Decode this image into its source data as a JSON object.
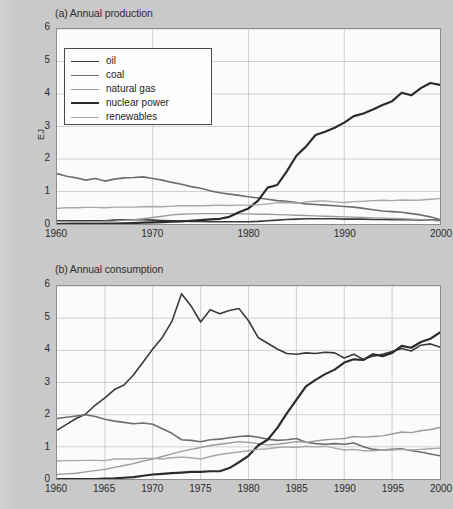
{
  "figure": {
    "ylabel": "EJ",
    "caption": ""
  },
  "legend": {
    "items": [
      {
        "label": "oil",
        "color": "#3a3a3a",
        "width": 1.6
      },
      {
        "label": "coal",
        "color": "#6e6e6e",
        "width": 1.6
      },
      {
        "label": "natural gas",
        "color": "#9b9b9b",
        "width": 1.4
      },
      {
        "label": "nuclear power",
        "color": "#2b2b2b",
        "width": 2.2
      },
      {
        "label": "renewables",
        "color": "#a8a8a8",
        "width": 1.4
      }
    ]
  },
  "chart_data": [
    {
      "type": "line",
      "panel": "a",
      "title": "(a) Annual production",
      "xlabel": "",
      "ylabel": "EJ",
      "xlim": [
        1960,
        2000
      ],
      "ylim": [
        0,
        6
      ],
      "xticks": [
        1960,
        1970,
        1980,
        1990,
        2000
      ],
      "yticks": [
        0,
        1,
        2,
        3,
        4,
        5,
        6
      ],
      "grid": true,
      "legend_position": "upper-left",
      "x": [
        1960,
        1961,
        1962,
        1963,
        1964,
        1965,
        1966,
        1967,
        1968,
        1969,
        1970,
        1971,
        1972,
        1973,
        1974,
        1975,
        1976,
        1977,
        1978,
        1979,
        1980,
        1981,
        1982,
        1983,
        1984,
        1985,
        1986,
        1987,
        1988,
        1989,
        1990,
        1991,
        1992,
        1993,
        1994,
        1995,
        1996,
        1997,
        1998,
        1999,
        2000
      ],
      "series": [
        {
          "name": "oil",
          "color": "#3a3a3a",
          "values": [
            0.1,
            0.1,
            0.1,
            0.1,
            0.1,
            0.1,
            0.12,
            0.13,
            0.13,
            0.13,
            0.12,
            0.11,
            0.1,
            0.09,
            0.08,
            0.08,
            0.07,
            0.07,
            0.07,
            0.07,
            0.07,
            0.08,
            0.1,
            0.12,
            0.14,
            0.15,
            0.16,
            0.16,
            0.16,
            0.16,
            0.15,
            0.15,
            0.15,
            0.14,
            0.14,
            0.13,
            0.13,
            0.13,
            0.12,
            0.12,
            0.12
          ]
        },
        {
          "name": "coal",
          "color": "#6e6e6e",
          "values": [
            1.55,
            1.47,
            1.42,
            1.35,
            1.4,
            1.32,
            1.38,
            1.42,
            1.43,
            1.45,
            1.4,
            1.35,
            1.28,
            1.22,
            1.15,
            1.1,
            1.02,
            0.96,
            0.92,
            0.88,
            0.84,
            0.8,
            0.76,
            0.72,
            0.7,
            0.66,
            0.62,
            0.6,
            0.58,
            0.56,
            0.54,
            0.52,
            0.48,
            0.44,
            0.4,
            0.38,
            0.36,
            0.32,
            0.28,
            0.22,
            0.14
          ]
        },
        {
          "name": "natural gas",
          "color": "#9b9b9b",
          "values": [
            0.02,
            0.03,
            0.04,
            0.05,
            0.06,
            0.08,
            0.09,
            0.11,
            0.13,
            0.16,
            0.2,
            0.24,
            0.28,
            0.3,
            0.31,
            0.32,
            0.32,
            0.32,
            0.32,
            0.31,
            0.31,
            0.3,
            0.3,
            0.29,
            0.28,
            0.27,
            0.26,
            0.25,
            0.24,
            0.23,
            0.22,
            0.21,
            0.2,
            0.19,
            0.18,
            0.17,
            0.16,
            0.15,
            0.13,
            0.11,
            0.09
          ]
        },
        {
          "name": "nuclear power",
          "color": "#2b2b2b",
          "values": [
            0.0,
            0.0,
            0.0,
            0.0,
            0.0,
            0.01,
            0.01,
            0.02,
            0.03,
            0.04,
            0.05,
            0.06,
            0.07,
            0.08,
            0.1,
            0.12,
            0.14,
            0.16,
            0.22,
            0.36,
            0.48,
            0.72,
            1.12,
            1.2,
            1.62,
            2.1,
            2.38,
            2.74,
            2.84,
            2.96,
            3.12,
            3.32,
            3.4,
            3.52,
            3.66,
            3.78,
            4.04,
            3.96,
            4.18,
            4.34,
            4.28,
            4.36,
            4.56
          ]
        },
        {
          "name": "renewables",
          "color": "#a8a8a8",
          "values": [
            0.48,
            0.5,
            0.5,
            0.51,
            0.51,
            0.5,
            0.52,
            0.52,
            0.52,
            0.53,
            0.54,
            0.53,
            0.55,
            0.56,
            0.56,
            0.56,
            0.57,
            0.58,
            0.57,
            0.58,
            0.58,
            0.59,
            0.62,
            0.65,
            0.66,
            0.64,
            0.68,
            0.7,
            0.71,
            0.68,
            0.66,
            0.69,
            0.7,
            0.72,
            0.73,
            0.72,
            0.74,
            0.73,
            0.74,
            0.76,
            0.78
          ]
        }
      ]
    },
    {
      "type": "line",
      "panel": "b",
      "title": "(b) Annual consumption",
      "xlabel": "",
      "ylabel": "EJ",
      "xlim": [
        1960,
        2000
      ],
      "ylim": [
        0,
        6
      ],
      "xticks": [
        1960,
        1965,
        1970,
        1975,
        1980,
        1985,
        1990,
        1995,
        2000
      ],
      "yticks": [
        0,
        1,
        2,
        3,
        4,
        5,
        6
      ],
      "grid": true,
      "legend_position": "none",
      "x": [
        1960,
        1961,
        1962,
        1963,
        1964,
        1965,
        1966,
        1967,
        1968,
        1969,
        1970,
        1971,
        1972,
        1973,
        1974,
        1975,
        1976,
        1977,
        1978,
        1979,
        1980,
        1981,
        1982,
        1983,
        1984,
        1985,
        1986,
        1987,
        1988,
        1989,
        1990,
        1991,
        1992,
        1993,
        1994,
        1995,
        1996,
        1997,
        1998,
        1999,
        2000
      ],
      "series": [
        {
          "name": "oil",
          "color": "#3a3a3a",
          "values": [
            1.52,
            1.7,
            1.88,
            2.02,
            2.3,
            2.52,
            2.78,
            2.92,
            3.24,
            3.64,
            4.04,
            4.4,
            4.9,
            5.76,
            5.38,
            4.88,
            5.26,
            5.14,
            5.24,
            5.3,
            4.92,
            4.4,
            4.22,
            4.04,
            3.9,
            3.88,
            3.92,
            3.9,
            3.94,
            3.92,
            3.76,
            3.88,
            3.72,
            3.82,
            3.88,
            3.96,
            4.06,
            3.98,
            4.16,
            4.2,
            4.1
          ]
        },
        {
          "name": "coal",
          "color": "#6e6e6e",
          "values": [
            1.88,
            1.92,
            1.96,
            2.0,
            1.94,
            1.86,
            1.8,
            1.76,
            1.72,
            1.74,
            1.7,
            1.56,
            1.42,
            1.22,
            1.2,
            1.16,
            1.22,
            1.24,
            1.28,
            1.32,
            1.34,
            1.3,
            1.24,
            1.2,
            1.22,
            1.26,
            1.14,
            1.1,
            1.08,
            1.1,
            1.08,
            1.12,
            1.0,
            0.92,
            0.9,
            0.92,
            0.94,
            0.88,
            0.84,
            0.78,
            0.72
          ]
        },
        {
          "name": "natural gas",
          "color": "#9b9b9b",
          "values": [
            0.14,
            0.16,
            0.18,
            0.22,
            0.26,
            0.3,
            0.36,
            0.42,
            0.48,
            0.56,
            0.62,
            0.7,
            0.78,
            0.86,
            0.92,
            0.98,
            1.04,
            1.08,
            1.12,
            1.16,
            1.14,
            1.1,
            1.06,
            1.08,
            1.12,
            1.16,
            1.14,
            1.18,
            1.22,
            1.24,
            1.26,
            1.32,
            1.3,
            1.32,
            1.34,
            1.4,
            1.46,
            1.44,
            1.5,
            1.54,
            1.6
          ]
        },
        {
          "name": "nuclear power",
          "color": "#2b2b2b",
          "values": [
            0.0,
            0.0,
            0.0,
            0.0,
            0.0,
            0.01,
            0.02,
            0.04,
            0.06,
            0.1,
            0.14,
            0.16,
            0.18,
            0.2,
            0.22,
            0.22,
            0.24,
            0.24,
            0.34,
            0.52,
            0.72,
            1.04,
            1.22,
            1.58,
            2.04,
            2.46,
            2.88,
            3.08,
            3.26,
            3.4,
            3.62,
            3.72,
            3.7,
            3.88,
            3.82,
            3.92,
            4.14,
            4.08,
            4.26,
            4.36,
            4.56
          ]
        },
        {
          "name": "renewables",
          "color": "#a8a8a8",
          "values": [
            0.56,
            0.57,
            0.57,
            0.58,
            0.58,
            0.57,
            0.62,
            0.62,
            0.62,
            0.64,
            0.64,
            0.62,
            0.66,
            0.68,
            0.66,
            0.62,
            0.7,
            0.76,
            0.8,
            0.84,
            0.88,
            0.92,
            0.94,
            0.98,
            1.0,
            0.98,
            1.02,
            1.0,
            1.02,
            0.96,
            0.9,
            0.92,
            0.88,
            0.88,
            0.9,
            0.9,
            0.92,
            0.9,
            0.92,
            0.94,
            0.96
          ]
        }
      ]
    }
  ]
}
